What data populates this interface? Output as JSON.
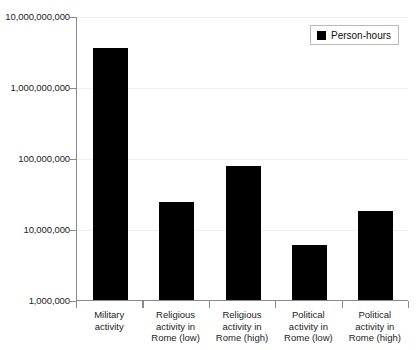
{
  "chart_data": {
    "type": "bar",
    "title": "",
    "xlabel": "",
    "ylabel": "",
    "yscale": "log",
    "ylim": [
      1000000,
      10000000000
    ],
    "grid": true,
    "legend_position": "top-right",
    "categories": [
      "Military activity",
      "Religious activity in Rome (low)",
      "Religious activity in Rome (high)",
      "Political activity in Rome (low)",
      "Political activity in Rome (high)"
    ],
    "category_lines": [
      [
        "Military",
        "activity"
      ],
      [
        "Religious",
        "activity in",
        "Rome (low)"
      ],
      [
        "Religious",
        "activity in",
        "Rome (high)"
      ],
      [
        "Political",
        "activity in",
        "Rome (low)"
      ],
      [
        "Political",
        "activity in",
        "Rome (high)"
      ]
    ],
    "series": [
      {
        "name": "Person-hours",
        "color": "#000000",
        "values": [
          3500000000,
          24000000,
          77000000,
          6000000,
          18000000
        ]
      }
    ],
    "y_ticks": [
      {
        "value": 10000000000,
        "label": "10,000,000,000"
      },
      {
        "value": 1000000000,
        "label": "1,000,000,000"
      },
      {
        "value": 100000000,
        "label": "100,000,000"
      },
      {
        "value": 10000000,
        "label": "10,000,000"
      },
      {
        "value": 1000000,
        "label": "1,000,000"
      }
    ]
  },
  "legend": {
    "entries": [
      {
        "label": "Person-hours",
        "color": "#000000"
      }
    ]
  },
  "colors": {
    "bar": "#000000",
    "axis": "#8a8a8a",
    "grid": "#eeeeee",
    "text": "#1d1d1d",
    "background": "#ffffff"
  }
}
